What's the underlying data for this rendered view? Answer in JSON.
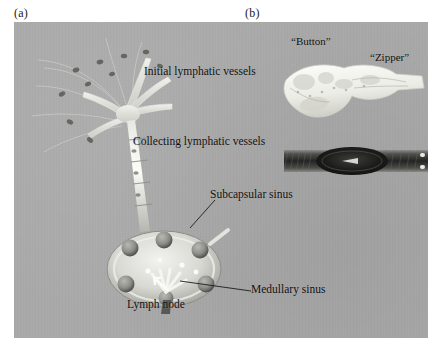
{
  "figure": {
    "panel_a_tag": "(a)",
    "panel_b_tag": "(b)",
    "background_color": "#a9a9a9",
    "label_color": "#111111"
  },
  "panel_a": {
    "labels": [
      {
        "id": "initial-lymphatic-vessels",
        "text": "Initial lymphatic vessels"
      },
      {
        "id": "collecting-lymphatic-vessels",
        "text": "Collecting lymphatic vessels"
      },
      {
        "id": "subcapsular-sinus",
        "text": "Subcapsular sinus"
      },
      {
        "id": "medullary-sinus",
        "text": "Medullary sinus"
      },
      {
        "id": "lymph-node",
        "text": "Lymph node"
      }
    ]
  },
  "panel_b": {
    "labels": [
      {
        "id": "button",
        "text": "“Button”"
      },
      {
        "id": "zipper",
        "text": "“Zipper”"
      }
    ]
  }
}
